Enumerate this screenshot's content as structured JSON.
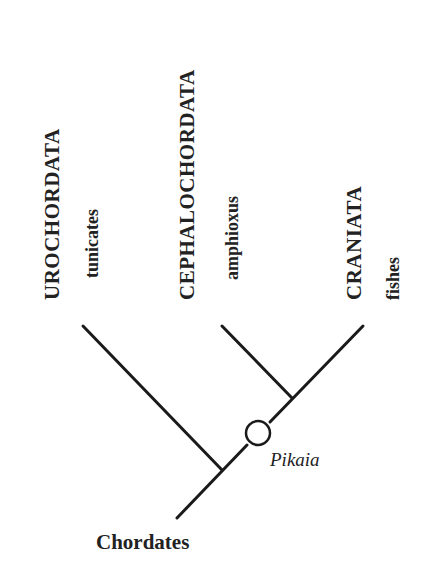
{
  "diagram": {
    "type": "cladogram",
    "root_label": "Chordates",
    "taxa": [
      {
        "group": "UROCHORDATA",
        "common": "tunicates"
      },
      {
        "group": "CEPHALOCHORDATA",
        "common": "amphioxus"
      },
      {
        "group": "CRANIATA",
        "common": "fishes"
      }
    ],
    "fossil_node": "Pikaia",
    "colors": {
      "line": "#1a1a1a",
      "background": "#ffffff"
    }
  }
}
